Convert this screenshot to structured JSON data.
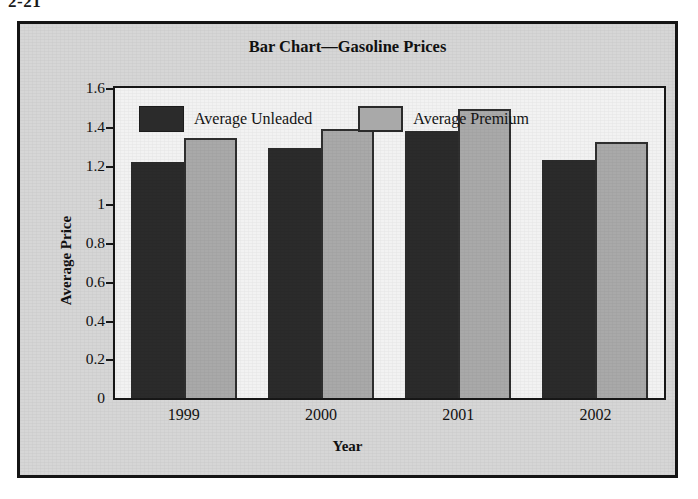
{
  "page_number": "2-21",
  "figure": {
    "title": "Bar Chart—Gasoline Prices"
  },
  "chart_data": {
    "type": "bar",
    "title": "Bar Chart—Gasoline Prices",
    "xlabel": "Year",
    "ylabel": "Average Price",
    "categories": [
      "1999",
      "2000",
      "2001",
      "2002"
    ],
    "series": [
      {
        "name": "Average Unleaded",
        "color": "#2b2b2b",
        "values": [
          1.22,
          1.29,
          1.38,
          1.23
        ]
      },
      {
        "name": "Average Premium",
        "color": "#a9a9a9",
        "values": [
          1.34,
          1.39,
          1.49,
          1.32
        ]
      }
    ],
    "ylim": [
      0,
      1.6
    ],
    "ytick_labels": [
      "0",
      "0.2",
      "0.4",
      "0.6",
      "0.8",
      "1",
      "1.2",
      "1.4",
      "1.6"
    ],
    "ytick_values": [
      0,
      0.2,
      0.4,
      0.6,
      0.8,
      1.0,
      1.2,
      1.4,
      1.6
    ],
    "grid": false,
    "legend_position": "top-left-inside"
  },
  "legend": [
    {
      "label": "Average Unleaded",
      "swatch": "dark"
    },
    {
      "label": "Average Premium",
      "swatch": "light"
    }
  ],
  "colors": {
    "unleaded": "#2b2b2b",
    "premium": "#a9a9a9",
    "frame": "#141414",
    "figure_background": "#d6d6d6",
    "plot_background": "#f2f2f2"
  }
}
